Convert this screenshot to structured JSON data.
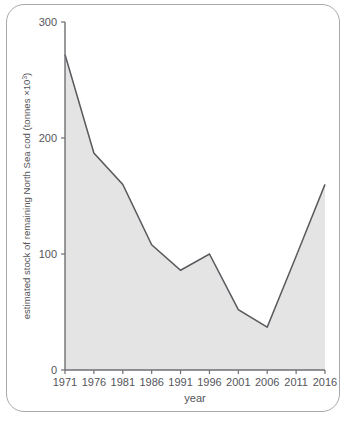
{
  "figure": {
    "frame_label": "figure-border",
    "caption_partial": ""
  },
  "chart_data": {
    "type": "area",
    "title": "",
    "xlabel": "year",
    "ylabel": "estimated stock of remaining North Sea cod (tonnes ×10³)",
    "ylabel_text": "estimated stock of remaining North Sea cod (tonnes ×10",
    "ylabel_sup": "3",
    "ylabel_tail": ")",
    "categories": [
      1971,
      1976,
      1981,
      1986,
      1991,
      1996,
      2001,
      2006,
      2011,
      2016
    ],
    "x_tick_labels": [
      "1971",
      "1976",
      "1981",
      "1986",
      "1991",
      "1996",
      "2001",
      "2006",
      "2011",
      "2016"
    ],
    "values": [
      272,
      187,
      160,
      108,
      86,
      100,
      52,
      37,
      98,
      160
    ],
    "y_tick_values": [
      0,
      100,
      200,
      300
    ],
    "y_tick_labels": [
      "0",
      "100",
      "200",
      "300"
    ],
    "ylim": [
      0,
      300
    ],
    "xlim": [
      1971,
      2016
    ],
    "grid": false,
    "legend": null,
    "series": [
      {
        "name": "estimated stock of remaining North Sea cod",
        "values": [
          272,
          187,
          160,
          108,
          86,
          100,
          52,
          37,
          98,
          160
        ]
      }
    ],
    "colors": {
      "area_fill": "#e4e4e4",
      "line": "#5a5a5f",
      "axis": "#6f6f74",
      "text": "#55555a",
      "frame_border": "#a9a9ad",
      "background": "#ffffff"
    }
  }
}
